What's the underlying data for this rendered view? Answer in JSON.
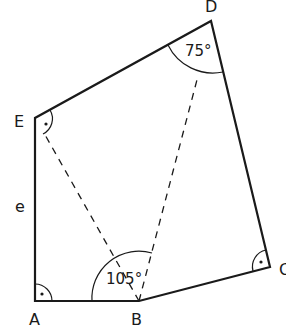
{
  "figure": {
    "type": "pentagon",
    "vertices": [
      {
        "name": "A",
        "x": 35,
        "y": 301
      },
      {
        "name": "B",
        "x": 139,
        "y": 301
      },
      {
        "name": "C",
        "x": 270,
        "y": 267
      },
      {
        "name": "D",
        "x": 211,
        "y": 21
      },
      {
        "name": "E",
        "x": 35,
        "y": 118
      }
    ],
    "labels": {
      "A": "A",
      "B": "B",
      "C": "C",
      "D": "D",
      "E": "E",
      "side_e": "e"
    },
    "angles": {
      "D": "75°",
      "B": "105°"
    },
    "right_angles": [
      "A",
      "C",
      "E"
    ],
    "diagonals": [
      "B-E",
      "B-D"
    ],
    "colors": {
      "stroke": "#1a1a1a",
      "background": "#ffffff"
    }
  }
}
